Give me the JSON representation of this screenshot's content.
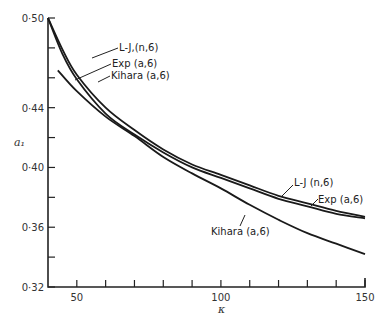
{
  "chart_data": {
    "type": "line",
    "title": "",
    "xlabel": "κ",
    "ylabel": "a₁",
    "xlim": [
      40,
      150
    ],
    "ylim": [
      0.32,
      0.5
    ],
    "grid": false,
    "legend_position": "inline labels with leader lines",
    "x_ticks": [
      50,
      60,
      70,
      80,
      90,
      100,
      110,
      120,
      130,
      140,
      150
    ],
    "x_tick_labels": [
      "50",
      "",
      "",
      "",
      "",
      "100",
      "",
      "",
      "",
      "",
      "150"
    ],
    "y_ticks": [
      0.32,
      0.34,
      0.36,
      0.38,
      0.4,
      0.42,
      0.44,
      0.46,
      0.48,
      0.5
    ],
    "y_tick_labels": [
      "0·32",
      "",
      "0·36",
      "",
      "0·40",
      "",
      "0·44",
      "",
      "",
      "0·50"
    ],
    "series": [
      {
        "name": "L-J (n,6)",
        "x": [
          40,
          45,
          50,
          60,
          70,
          80,
          90,
          100,
          110,
          120,
          130,
          140,
          150
        ],
        "y": [
          0.5,
          0.479,
          0.462,
          0.44,
          0.425,
          0.412,
          0.402,
          0.395,
          0.388,
          0.381,
          0.376,
          0.371,
          0.367
        ]
      },
      {
        "name": "Exp (a,6)",
        "x": [
          40,
          45,
          50,
          60,
          70,
          80,
          90,
          100,
          110,
          120,
          130,
          140,
          150
        ],
        "y": [
          0.5,
          0.476,
          0.459,
          0.436,
          0.422,
          0.41,
          0.4,
          0.393,
          0.386,
          0.379,
          0.374,
          0.369,
          0.366
        ]
      },
      {
        "name": "Kihara (a,6)",
        "x": [
          43.4,
          50,
          60,
          70,
          80,
          90,
          100,
          110,
          120,
          130,
          140,
          150
        ],
        "y": [
          0.465,
          0.451,
          0.434,
          0.421,
          0.407,
          0.396,
          0.386,
          0.375,
          0.365,
          0.356,
          0.349,
          0.342
        ]
      }
    ],
    "annotations": [
      {
        "text": "L-J,(n,6)",
        "position": "upper-left"
      },
      {
        "text": "Exp (a,6)",
        "position": "upper-left"
      },
      {
        "text": "Kihara (a,6)",
        "position": "upper-left"
      },
      {
        "text": "L-J (n,6)",
        "position": "right"
      },
      {
        "text": "Exp (a,6)",
        "position": "right"
      },
      {
        "text": "Kihara (a,6)",
        "position": "lower-middle"
      }
    ]
  },
  "labels": {
    "upper_lj": "L-J,(n,6)",
    "upper_exp": "Exp (a,6)",
    "upper_kihara": "Kihara (a,6)",
    "right_lj": "L-J (n,6)",
    "right_exp": "Exp (a,6)",
    "lower_kihara": "Kihara (a,6)",
    "x_axis": "κ",
    "y_axis": "a₁"
  }
}
